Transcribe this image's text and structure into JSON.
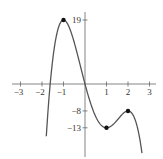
{
  "chart_data": {
    "type": "line",
    "title": "",
    "xlabel": "",
    "ylabel": "",
    "function": "f(x) = -3x^4 + 8x^3 + 6x^2 - 24x",
    "xlim": [
      -3.3,
      3.3
    ],
    "ylim": [
      -25,
      23
    ],
    "grid": false,
    "x_ticks": [
      -3,
      -2,
      -1,
      1,
      2,
      3
    ],
    "x_tick_labels": [
      "−3",
      "−2",
      "−1",
      "1",
      "2",
      "3"
    ],
    "y_ticks": [
      19,
      -8,
      -13
    ],
    "y_tick_labels": [
      "19",
      "−8",
      "−13"
    ],
    "marked_points": [
      {
        "x": -1,
        "y": 19,
        "label": "local maximum"
      },
      {
        "x": 1,
        "y": -13,
        "label": "local minimum"
      },
      {
        "x": 2,
        "y": -8,
        "label": "local maximum"
      }
    ],
    "series": [
      {
        "name": "f(x)",
        "x": [
          -1.75,
          -1.5,
          -1.25,
          -1.0,
          -0.75,
          -0.5,
          -0.25,
          0,
          0.25,
          0.5,
          0.75,
          1.0,
          1.25,
          1.5,
          1.75,
          2.0,
          2.25,
          2.5,
          2.6
        ],
        "values": [
          -15.5,
          5.3,
          16.3,
          19,
          16.4,
          11.3,
          5.4,
          0,
          -4.8,
          -8.7,
          -11.6,
          -13,
          -12.8,
          -11.2,
          -9.0,
          -8,
          -10.1,
          -18.4,
          -23.9
        ]
      }
    ]
  },
  "colors": {
    "curve": "#555555",
    "axis": "#666666",
    "point": "#111111",
    "background": "#ffffff"
  }
}
